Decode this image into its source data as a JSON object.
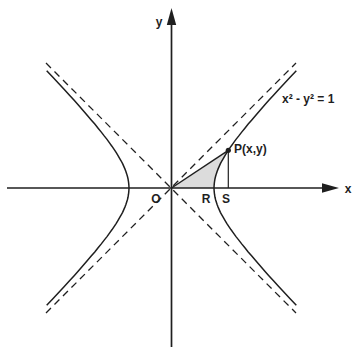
{
  "figure_type": "hyperbola-diagram",
  "colors": {
    "line": "#1f1f1f",
    "shade": "#dcdcdc",
    "background": "#ffffff"
  },
  "labels": {
    "y_axis": "y",
    "x_axis": "x",
    "origin": "O",
    "r": "R",
    "s": "S",
    "p": "P(x,y)",
    "equation": "x² - y² = 1"
  }
}
